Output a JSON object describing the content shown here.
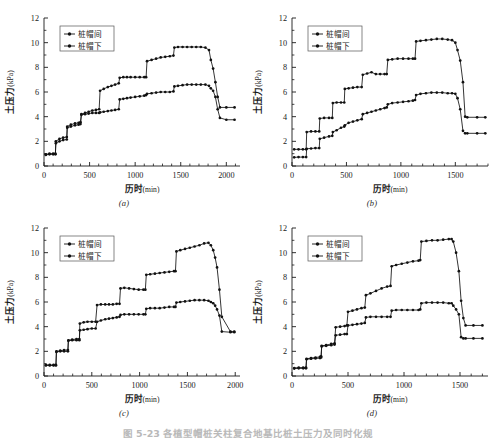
{
  "figure": {
    "caption": "图 5-23  各植型帽桩关柱复合地基比桩土压力及同时化规",
    "panels_order": [
      "a",
      "b",
      "c",
      "d"
    ]
  },
  "axes": {
    "ylabel_main": "土压力",
    "ylabel_unit": "(kPa)",
    "xlabel_main": "历时",
    "xlabel_unit": "(min)",
    "yticks": [
      0,
      2,
      4,
      6,
      8,
      10,
      12
    ],
    "ylim": [
      0,
      12
    ]
  },
  "legend": {
    "series1": "桩帽间",
    "series2": "桩帽下"
  },
  "chart_data": [
    {
      "type": "line",
      "panel": "a",
      "label": "(a)",
      "title": "",
      "xlabel": "历时(min)",
      "ylabel": "土压力(kPa)",
      "xlim": [
        0,
        2150
      ],
      "ylim": [
        0,
        12
      ],
      "xticks": [
        0,
        500,
        1000,
        1500,
        2000
      ],
      "yticks": [
        0,
        2,
        4,
        6,
        8,
        10,
        12
      ],
      "grid": false,
      "legend_position": "top-left",
      "series": [
        {
          "name": "桩帽间",
          "x": [
            20,
            60,
            100,
            125,
            130,
            170,
            210,
            250,
            255,
            295,
            340,
            380,
            400,
            410,
            450,
            490,
            530,
            570,
            605,
            615,
            655,
            700,
            740,
            780,
            820,
            830,
            870,
            910,
            950,
            1000,
            1050,
            1100,
            1120,
            1130,
            1180,
            1230,
            1280,
            1330,
            1380,
            1420,
            1430,
            1470,
            1520,
            1570,
            1620,
            1670,
            1720,
            1770,
            1810,
            1830,
            1855,
            1880,
            1905,
            1930,
            2000,
            2090
          ],
          "y": [
            0.95,
            1.0,
            1.0,
            1.0,
            2.0,
            2.2,
            2.3,
            2.35,
            3.2,
            3.35,
            3.45,
            3.5,
            3.55,
            4.2,
            4.3,
            4.4,
            4.5,
            4.55,
            4.6,
            6.1,
            6.25,
            6.4,
            6.5,
            6.6,
            6.7,
            7.15,
            7.2,
            7.2,
            7.2,
            7.2,
            7.2,
            7.2,
            7.2,
            8.5,
            8.6,
            8.7,
            8.8,
            8.85,
            8.9,
            8.95,
            9.6,
            9.65,
            9.65,
            9.65,
            9.65,
            9.65,
            9.65,
            9.6,
            9.4,
            8.6,
            7.9,
            6.8,
            5.6,
            4.75,
            4.75,
            4.75
          ]
        },
        {
          "name": "桩帽下",
          "x": [
            20,
            60,
            100,
            125,
            130,
            170,
            210,
            250,
            255,
            295,
            340,
            380,
            400,
            410,
            450,
            490,
            530,
            570,
            605,
            615,
            655,
            700,
            740,
            780,
            820,
            830,
            870,
            910,
            950,
            1000,
            1050,
            1100,
            1120,
            1130,
            1180,
            1230,
            1280,
            1330,
            1380,
            1420,
            1430,
            1470,
            1520,
            1570,
            1620,
            1670,
            1720,
            1770,
            1810,
            1830,
            1855,
            1880,
            1905,
            1930,
            2000,
            2090
          ],
          "y": [
            0.9,
            0.95,
            0.95,
            0.95,
            1.85,
            2.0,
            2.1,
            2.15,
            3.1,
            3.2,
            3.3,
            3.35,
            3.4,
            4.15,
            4.2,
            4.25,
            4.3,
            4.3,
            4.3,
            4.35,
            4.4,
            4.45,
            4.5,
            4.55,
            4.6,
            5.4,
            5.45,
            5.5,
            5.55,
            5.6,
            5.65,
            5.7,
            5.75,
            5.85,
            5.9,
            5.95,
            6.0,
            6.0,
            6.0,
            6.05,
            6.45,
            6.5,
            6.55,
            6.6,
            6.6,
            6.6,
            6.6,
            6.6,
            6.5,
            6.3,
            6.1,
            5.6,
            4.6,
            3.9,
            3.75,
            3.75
          ]
        }
      ]
    },
    {
      "type": "line",
      "panel": "b",
      "label": "(b)",
      "title": "",
      "xlabel": "历时(min)",
      "ylabel": "土压力(kPa)",
      "xlim": [
        0,
        1800
      ],
      "ylim": [
        0,
        12
      ],
      "xticks": [
        0,
        500,
        1000,
        1500
      ],
      "yticks": [
        0,
        2,
        4,
        6,
        8,
        10,
        12
      ],
      "grid": false,
      "legend_position": "top-left",
      "series": [
        {
          "name": "桩帽间",
          "x": [
            20,
            60,
            100,
            130,
            135,
            175,
            215,
            250,
            255,
            295,
            340,
            370,
            375,
            410,
            450,
            480,
            485,
            520,
            560,
            600,
            640,
            650,
            690,
            730,
            770,
            810,
            850,
            870,
            880,
            920,
            970,
            1020,
            1070,
            1110,
            1130,
            1140,
            1180,
            1230,
            1280,
            1330,
            1380,
            1430,
            1470,
            1500,
            1520,
            1545,
            1570,
            1590,
            1610,
            1700,
            1775
          ],
          "y": [
            1.35,
            1.35,
            1.35,
            1.35,
            2.75,
            2.8,
            2.8,
            2.8,
            3.85,
            3.9,
            3.9,
            3.9,
            5.1,
            5.15,
            5.15,
            5.15,
            6.25,
            6.3,
            6.35,
            6.4,
            6.4,
            7.4,
            7.5,
            7.6,
            7.45,
            7.45,
            7.45,
            7.45,
            8.6,
            8.65,
            8.7,
            8.7,
            8.7,
            8.7,
            8.7,
            10.1,
            10.15,
            10.2,
            10.25,
            10.3,
            10.3,
            10.25,
            10.2,
            10.0,
            9.4,
            8.55,
            6.8,
            4.0,
            3.95,
            3.95,
            3.95
          ]
        },
        {
          "name": "桩帽下",
          "x": [
            20,
            60,
            100,
            130,
            135,
            175,
            215,
            250,
            255,
            295,
            340,
            370,
            375,
            410,
            450,
            480,
            485,
            520,
            560,
            600,
            640,
            650,
            690,
            730,
            770,
            810,
            850,
            870,
            880,
            920,
            970,
            1020,
            1070,
            1110,
            1130,
            1140,
            1180,
            1230,
            1280,
            1330,
            1380,
            1430,
            1470,
            1500,
            1520,
            1545,
            1570,
            1590,
            1610,
            1700,
            1775
          ],
          "y": [
            0.7,
            0.72,
            0.72,
            0.72,
            1.4,
            1.42,
            1.45,
            1.45,
            2.2,
            2.3,
            2.4,
            2.45,
            2.75,
            2.9,
            3.1,
            3.2,
            3.3,
            3.5,
            3.6,
            3.7,
            3.8,
            4.2,
            4.3,
            4.4,
            4.5,
            4.6,
            4.7,
            4.75,
            5.0,
            5.1,
            5.15,
            5.2,
            5.25,
            5.3,
            5.35,
            5.75,
            5.85,
            5.9,
            5.95,
            5.95,
            5.95,
            5.9,
            5.9,
            5.85,
            5.5,
            4.6,
            2.85,
            2.65,
            2.65,
            2.65,
            2.65
          ]
        }
      ]
    },
    {
      "type": "line",
      "panel": "c",
      "label": "(c)",
      "title": "",
      "xlabel": "历时(min)",
      "ylabel": "土压力(kPa)",
      "xlim": [
        0,
        2050
      ],
      "ylim": [
        0,
        12
      ],
      "xticks": [
        0,
        500,
        1000,
        1500,
        2000
      ],
      "yticks": [
        0,
        2,
        4,
        6,
        8,
        10,
        12
      ],
      "grid": false,
      "legend_position": "top-left",
      "series": [
        {
          "name": "桩帽间",
          "x": [
            20,
            60,
            100,
            125,
            130,
            170,
            210,
            250,
            255,
            295,
            340,
            370,
            375,
            415,
            455,
            500,
            540,
            555,
            595,
            640,
            680,
            720,
            760,
            790,
            800,
            840,
            890,
            940,
            990,
            1040,
            1060,
            1070,
            1110,
            1160,
            1210,
            1260,
            1310,
            1360,
            1375,
            1385,
            1425,
            1475,
            1525,
            1575,
            1625,
            1675,
            1720,
            1745,
            1770,
            1790,
            1810,
            1835,
            1860,
            1950,
            1990
          ],
          "y": [
            0.9,
            0.9,
            0.9,
            0.9,
            2.0,
            2.05,
            2.1,
            2.1,
            2.9,
            2.95,
            3.0,
            3.0,
            4.25,
            4.35,
            4.4,
            4.4,
            4.4,
            5.75,
            5.8,
            5.8,
            5.8,
            5.8,
            5.85,
            5.85,
            7.1,
            7.15,
            7.1,
            7.05,
            7.0,
            7.0,
            7.0,
            8.2,
            8.25,
            8.3,
            8.35,
            8.4,
            8.45,
            8.5,
            8.5,
            10.1,
            10.2,
            10.3,
            10.4,
            10.5,
            10.6,
            10.75,
            10.8,
            10.6,
            10.2,
            9.6,
            8.8,
            7.0,
            4.8,
            3.6,
            3.6
          ]
        },
        {
          "name": "桩帽下",
          "x": [
            20,
            60,
            100,
            125,
            130,
            170,
            210,
            250,
            255,
            295,
            340,
            370,
            375,
            415,
            455,
            500,
            540,
            555,
            595,
            640,
            680,
            720,
            760,
            790,
            800,
            840,
            890,
            940,
            990,
            1040,
            1060,
            1070,
            1110,
            1160,
            1210,
            1260,
            1310,
            1360,
            1375,
            1385,
            1425,
            1475,
            1525,
            1575,
            1625,
            1675,
            1720,
            1745,
            1770,
            1790,
            1810,
            1835,
            1860,
            1950,
            1990
          ],
          "y": [
            0.85,
            0.85,
            0.85,
            0.85,
            1.95,
            2.0,
            2.0,
            2.0,
            2.85,
            2.9,
            2.9,
            2.9,
            3.7,
            3.75,
            3.8,
            3.85,
            3.85,
            4.4,
            4.5,
            4.6,
            4.65,
            4.7,
            4.75,
            4.8,
            4.95,
            5.0,
            5.0,
            5.0,
            5.0,
            5.0,
            5.0,
            5.45,
            5.5,
            5.5,
            5.5,
            5.55,
            5.6,
            5.6,
            5.6,
            5.95,
            6.0,
            6.05,
            6.1,
            6.15,
            6.15,
            6.15,
            6.1,
            6.0,
            5.9,
            5.7,
            5.4,
            4.9,
            3.6,
            3.55,
            3.55
          ]
        }
      ]
    },
    {
      "type": "line",
      "panel": "d",
      "label": "(d)",
      "title": "",
      "xlabel": "历时(min)",
      "ylabel": "土压力(kPa)",
      "xlim": [
        0,
        1750
      ],
      "ylim": [
        0,
        12
      ],
      "xticks": [
        0,
        500,
        1000,
        1500
      ],
      "yticks": [
        0,
        2,
        4,
        6,
        8,
        10,
        12
      ],
      "grid": false,
      "legend_position": "top-left",
      "series": [
        {
          "name": "桩帽间",
          "x": [
            20,
            60,
            100,
            125,
            130,
            170,
            210,
            250,
            260,
            265,
            305,
            350,
            380,
            390,
            430,
            470,
            490,
            500,
            540,
            580,
            620,
            650,
            660,
            700,
            750,
            800,
            850,
            880,
            890,
            930,
            980,
            1030,
            1080,
            1130,
            1145,
            1155,
            1200,
            1250,
            1300,
            1350,
            1400,
            1425,
            1440,
            1465,
            1490,
            1510,
            1530,
            1550,
            1620,
            1700
          ],
          "y": [
            0.65,
            0.68,
            0.68,
            0.68,
            1.4,
            1.45,
            1.5,
            1.55,
            1.6,
            2.45,
            2.5,
            2.6,
            2.65,
            3.95,
            4.0,
            4.05,
            4.1,
            5.2,
            5.3,
            5.4,
            5.5,
            5.55,
            6.55,
            6.7,
            6.9,
            7.1,
            7.25,
            7.3,
            8.9,
            9.0,
            9.1,
            9.2,
            9.3,
            9.35,
            9.4,
            10.9,
            10.95,
            11.0,
            11.0,
            11.05,
            11.1,
            11.1,
            10.9,
            10.0,
            8.5,
            6.1,
            4.7,
            4.1,
            4.1,
            4.1
          ]
        },
        {
          "name": "桩帽下",
          "x": [
            20,
            60,
            100,
            125,
            130,
            170,
            210,
            250,
            260,
            265,
            305,
            350,
            380,
            390,
            430,
            470,
            490,
            500,
            540,
            580,
            620,
            650,
            660,
            700,
            750,
            800,
            850,
            880,
            890,
            930,
            980,
            1030,
            1080,
            1130,
            1145,
            1155,
            1200,
            1250,
            1300,
            1350,
            1400,
            1425,
            1440,
            1465,
            1490,
            1510,
            1530,
            1550,
            1620,
            1700
          ],
          "y": [
            0.6,
            0.62,
            0.62,
            0.62,
            1.35,
            1.4,
            1.42,
            1.45,
            1.5,
            2.4,
            2.45,
            2.5,
            2.55,
            3.3,
            3.35,
            3.4,
            3.4,
            4.1,
            4.15,
            4.2,
            4.25,
            4.3,
            4.75,
            4.8,
            4.8,
            4.8,
            4.8,
            4.8,
            5.3,
            5.35,
            5.35,
            5.35,
            5.35,
            5.35,
            5.4,
            5.9,
            5.95,
            5.95,
            5.95,
            5.95,
            5.9,
            5.9,
            5.7,
            5.4,
            5.0,
            3.15,
            3.05,
            3.05,
            3.05,
            3.05
          ]
        }
      ]
    }
  ]
}
